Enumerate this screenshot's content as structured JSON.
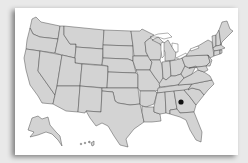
{
  "map": {
    "title": "United States map",
    "region": "USA",
    "colors": {
      "background": "#e9e9e9",
      "card": "#ffffff",
      "state_fill": "#d3d3d3",
      "state_border": "#3c3c3c",
      "marker": "#111111"
    },
    "marker": {
      "state": "Georgia",
      "x": 181,
      "y": 102
    },
    "insets": [
      "Alaska",
      "Hawaii"
    ]
  }
}
